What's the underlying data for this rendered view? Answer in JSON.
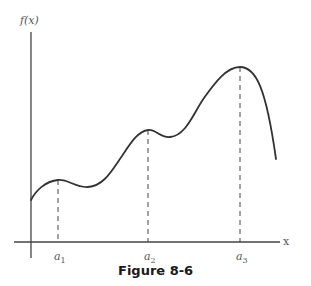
{
  "figure": {
    "caption": "Figure 8-6",
    "y_axis_label": "f(x)",
    "x_axis_label": "x",
    "points": [
      {
        "name": "a",
        "sub": "1"
      },
      {
        "name": "a",
        "sub": "2"
      },
      {
        "name": "a",
        "sub": "3"
      }
    ],
    "colors": {
      "curve": "#333333",
      "axes": "#444444",
      "dashes": "#444444",
      "text": "#555555"
    }
  }
}
